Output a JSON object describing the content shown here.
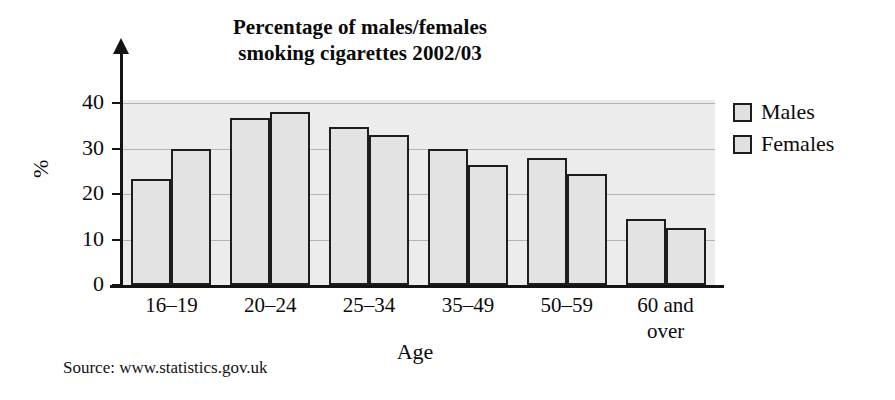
{
  "chart_data": {
    "type": "bar",
    "title": "Percentage of males/females smoking cigarettes 2002/03",
    "title_lines": [
      "Percentage of males/females",
      "smoking cigarettes 2002/03"
    ],
    "xlabel": "Age",
    "ylabel": "%",
    "ylim": [
      0,
      44
    ],
    "yticks": [
      0,
      10,
      20,
      30,
      40
    ],
    "ytick_labels": [
      "0",
      "10",
      "20",
      "30",
      "40"
    ],
    "grid": "horizontal",
    "legend_position": "right",
    "categories": [
      "16–19",
      "20–24",
      "25–34",
      "35–49",
      "50–59",
      "60 and over"
    ],
    "series": [
      {
        "name": "Males",
        "values": [
          23.3,
          36.7,
          34.8,
          29.8,
          28.0,
          14.5
        ]
      },
      {
        "name": "Females",
        "values": [
          30.0,
          38.0,
          33.0,
          26.4,
          24.4,
          12.5
        ]
      }
    ],
    "source": "Source: www.statistics.gov.uk",
    "colors": {
      "bar_fill": "#e3e3e4",
      "bar_stroke": "#1d1d1d",
      "plot_background": "#ececed",
      "gridline": "#b4b4b4",
      "axis": "#141414",
      "text": "#0b0b0b",
      "page_background": "#ffffff"
    }
  },
  "legend": {
    "items": [
      {
        "label": "Males"
      },
      {
        "label": "Females"
      }
    ]
  }
}
